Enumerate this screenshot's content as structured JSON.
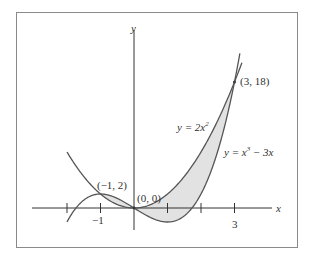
{
  "chart_data": {
    "type": "line",
    "title": "",
    "xlabel": "x",
    "ylabel": "y",
    "grid": false,
    "shaded_region": "area between y = 2x^2 and y = x^3 - 3x from x = -1 to x = 3",
    "x_ticks": [
      -2,
      -1,
      1,
      2,
      3
    ],
    "x_tick_labels": [
      {
        "x": -1,
        "label": "−1"
      },
      {
        "x": 3,
        "label": "3"
      }
    ],
    "series": [
      {
        "name": "y = 2x^2",
        "x": [
          -2,
          -1.5,
          -1,
          -0.5,
          0,
          0.5,
          1,
          1.5,
          2,
          2.5,
          3,
          3.2
        ],
        "values": [
          8,
          4.5,
          2,
          0.5,
          0,
          0.5,
          2,
          4.5,
          8,
          12.5,
          18,
          20.48
        ]
      },
      {
        "name": "y = x^3 - 3x",
        "x": [
          -2,
          -1.5,
          -1,
          -0.5,
          0,
          0.5,
          1,
          1.5,
          2,
          2.5,
          3,
          3.15
        ],
        "values": [
          -2,
          1.125,
          2,
          1.375,
          0,
          -1.375,
          -2,
          -1.125,
          2,
          8.125,
          18,
          21.8
        ]
      }
    ],
    "annotations": [
      {
        "point": [
          -1,
          2
        ],
        "label": "(−1, 2)"
      },
      {
        "point": [
          0,
          0
        ],
        "label": "(0, 0)"
      },
      {
        "point": [
          3,
          18
        ],
        "label": "(3, 18)"
      }
    ],
    "xlim": [
      -3,
      4.1
    ],
    "ylim": [
      -3,
      22
    ]
  },
  "labels": {
    "axis_x": "x",
    "axis_y": "y",
    "tick_neg1": "−1",
    "tick_3": "3",
    "pt_neg1_2": "(−1, 2)",
    "pt_origin": "(0, 0)",
    "pt_3_18": "(3, 18)",
    "parabola_prefix": "y = 2x",
    "parabola_exp": "2",
    "cubic_prefix": "y = x",
    "cubic_exp": "3",
    "cubic_suffix": " − 3x"
  },
  "colors": {
    "curve": "#555555",
    "fill": "#e2e2e2",
    "axis": "#333333",
    "frame": "#8a8a8a"
  }
}
